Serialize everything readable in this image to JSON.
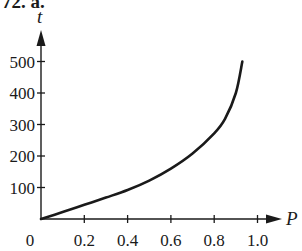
{
  "header": {
    "label": "72. a."
  },
  "chart_data": {
    "type": "line",
    "title": "",
    "xlabel": "P",
    "ylabel": "t",
    "xlim": [
      0,
      1.0
    ],
    "ylim": [
      0,
      500
    ],
    "x_ticks": [
      "0",
      "0.2",
      "0.4",
      "0.6",
      "0.8",
      "1.0"
    ],
    "y_ticks": [
      "100",
      "200",
      "300",
      "400",
      "500"
    ],
    "grid": false,
    "legend": null,
    "series": [
      {
        "name": "t vs P",
        "x": [
          0,
          0.1,
          0.2,
          0.3,
          0.4,
          0.5,
          0.6,
          0.7,
          0.8,
          0.85,
          0.9,
          0.93
        ],
        "y": [
          0,
          22,
          45,
          68,
          92,
          122,
          160,
          208,
          272,
          318,
          400,
          500
        ]
      }
    ],
    "color": "#1a1a1a"
  },
  "axes": {
    "origin_label": "0",
    "x_label": "P",
    "y_label": "t"
  }
}
